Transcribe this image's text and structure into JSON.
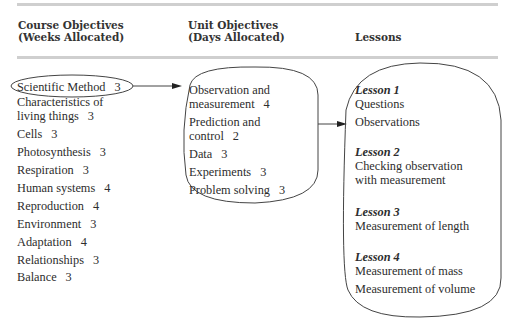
{
  "headers": {
    "course": [
      "Course Objectives",
      "(Weeks Allocated)"
    ],
    "unit": [
      "Unit Objectives",
      "(Days Allocated)"
    ],
    "lessons": "Lessons"
  },
  "course_objectives": [
    {
      "label": "Scientific Method",
      "weeks": "3",
      "highlighted": true
    },
    {
      "label": "Characteristics of",
      "label2": "living things",
      "weeks": "3"
    },
    {
      "label": "Cells",
      "weeks": "3"
    },
    {
      "label": "Photosynthesis",
      "weeks": "3"
    },
    {
      "label": "Respiration",
      "weeks": "3"
    },
    {
      "label": "Human systems",
      "weeks": "4"
    },
    {
      "label": "Reproduction",
      "weeks": "4"
    },
    {
      "label": "Environment",
      "weeks": "3"
    },
    {
      "label": "Adaptation",
      "weeks": "4"
    },
    {
      "label": "Relationships",
      "weeks": "3"
    },
    {
      "label": "Balance",
      "weeks": "3"
    }
  ],
  "unit_objectives": [
    {
      "label": "Observation and",
      "label2": "measurement",
      "days": "4"
    },
    {
      "label": "Prediction and",
      "label2": "control",
      "days": "2"
    },
    {
      "label": "Data",
      "days": "3"
    },
    {
      "label": "Experiments",
      "days": "3"
    },
    {
      "label": "Problem solving",
      "days": "3"
    }
  ],
  "lessons": [
    {
      "title": "Lesson 1",
      "items": [
        "Questions",
        "Observations"
      ]
    },
    {
      "title": "Lesson 2",
      "items": [
        "Checking observation",
        "with measurement"
      ]
    },
    {
      "title": "Lesson 3",
      "items": [
        "Measurement of length"
      ]
    },
    {
      "title": "Lesson 4",
      "items": [
        "Measurement of mass",
        "Measurement of volume"
      ]
    }
  ]
}
